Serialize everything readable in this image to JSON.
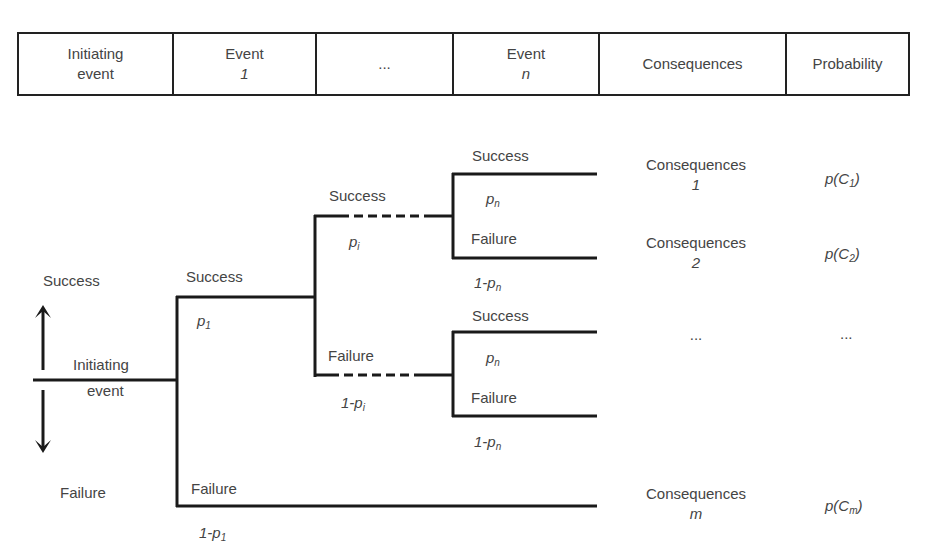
{
  "title_partial": "... analysis by event tree diagram ...",
  "header": {
    "columns": [
      {
        "line1": "Initiating",
        "line2": "event",
        "line2_italic": false
      },
      {
        "line1": "Event",
        "line2": "1",
        "line2_italic": true
      },
      {
        "line1": "...",
        "line2": "",
        "line2_italic": false
      },
      {
        "line1": "Event",
        "line2": "n",
        "line2_italic": true
      },
      {
        "line1": "Consequences",
        "line2": "",
        "line2_italic": false
      },
      {
        "line1": "Probability",
        "line2": "",
        "line2_italic": false
      }
    ]
  },
  "tree": {
    "initiating": {
      "line1": "Initiating",
      "line2": "event",
      "up_label": "Success",
      "down_label": "Failure"
    },
    "event1": {
      "success_label": "Success",
      "success_prob": "p",
      "success_prob_sub": "1",
      "failure_label": "Failure",
      "failure_prob": "1-p",
      "failure_prob_sub": "1"
    },
    "eventi": {
      "success_label": "Success",
      "success_prob": "p",
      "success_prob_sub": "i",
      "failure_label": "Failure",
      "failure_prob": "1-p",
      "failure_prob_sub": "i"
    },
    "eventn_upper": {
      "success_label": "Success",
      "success_prob": "p",
      "success_prob_sub": "n",
      "failure_label": "Failure",
      "failure_prob": "1-p",
      "failure_prob_sub": "n"
    },
    "eventn_lower": {
      "success_label": "Success",
      "success_prob": "p",
      "success_prob_sub": "n",
      "failure_label": "Failure",
      "failure_prob": "1-p",
      "failure_prob_sub": "n"
    }
  },
  "outcomes": [
    {
      "cons_line1": "Consequences",
      "cons_line2": "1",
      "prob": "p(C",
      "prob_sub": "1",
      "prob_close": ")"
    },
    {
      "cons_line1": "Consequences",
      "cons_line2": "2",
      "prob": "p(C",
      "prob_sub": "2",
      "prob_close": ")"
    },
    {
      "cons_line1": "...",
      "cons_line2": "",
      "prob": "...",
      "prob_sub": "",
      "prob_close": ""
    },
    {
      "cons_line1": "Consequences",
      "cons_line2": "m",
      "prob": "p(C",
      "prob_sub": "m",
      "prob_close": ")"
    }
  ],
  "colors": {
    "line": "#1a1a1a",
    "text": "#444444",
    "background": "#ffffff"
  }
}
